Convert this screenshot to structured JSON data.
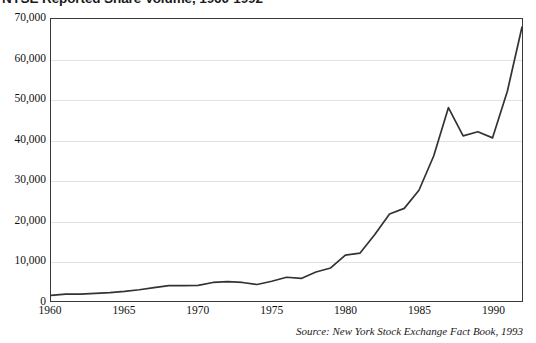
{
  "figure": {
    "title": "NYSE Reported Share Volume, 1960-1992",
    "source_note": "Source: New York Stock Exchange Fact Book, 1993"
  },
  "chart_data": {
    "type": "line",
    "title": "NYSE Reported Share Volume, 1960-1992",
    "xlabel": "",
    "ylabel": "",
    "xlim": [
      1960,
      1992
    ],
    "ylim": [
      0,
      70000
    ],
    "grid": true,
    "legend": false,
    "units": "millions of shares",
    "y_tick_labels": [
      "0",
      "10,000",
      "20,000",
      "30,000",
      "40,000",
      "50,000",
      "60,000",
      "70,000"
    ],
    "y_tick_values": [
      0,
      10000,
      20000,
      30000,
      40000,
      50000,
      60000,
      70000
    ],
    "x_tick_labels": [
      "1960",
      "1965",
      "1970",
      "1975",
      "1980",
      "1985",
      "1990"
    ],
    "x_tick_values": [
      1960,
      1965,
      1970,
      1975,
      1980,
      1985,
      1990
    ],
    "x": [
      1960,
      1961,
      1962,
      1963,
      1964,
      1965,
      1966,
      1967,
      1968,
      1969,
      1970,
      1971,
      1972,
      1973,
      1974,
      1975,
      1976,
      1977,
      1978,
      1979,
      1980,
      1981,
      1982,
      1983,
      1984,
      1985,
      1986,
      1987,
      1988,
      1989,
      1990,
      1991,
      1992
    ],
    "values": [
      1400,
      1700,
      1700,
      1900,
      2100,
      2400,
      2800,
      3300,
      3800,
      3800,
      3900,
      4600,
      4800,
      4600,
      4100,
      4900,
      5900,
      5600,
      7200,
      8200,
      11400,
      11900,
      16500,
      21600,
      23000,
      27500,
      36000,
      48000,
      41000,
      42000,
      40500,
      52000,
      68000
    ],
    "annotations": []
  }
}
